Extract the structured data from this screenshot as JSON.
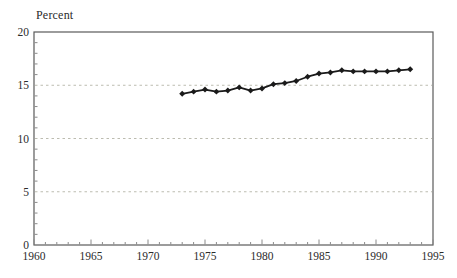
{
  "chart_data": {
    "type": "line",
    "title": "",
    "ylabel": "Percent",
    "xlabel": "",
    "xlim": [
      1960,
      1995
    ],
    "ylim": [
      0,
      20
    ],
    "x_ticks": [
      1960,
      1965,
      1970,
      1975,
      1980,
      1985,
      1990,
      1995
    ],
    "y_ticks": [
      0,
      5,
      10,
      15,
      20
    ],
    "grid": "horizontal dashed lines at 5, 10, 15",
    "legend": "none",
    "series": [
      {
        "name": "Percent",
        "x": [
          1973,
          1974,
          1975,
          1976,
          1977,
          1978,
          1979,
          1980,
          1981,
          1982,
          1983,
          1984,
          1985,
          1986,
          1987,
          1988,
          1989,
          1990,
          1991,
          1992,
          1993
        ],
        "values": [
          14.2,
          14.4,
          14.6,
          14.4,
          14.5,
          14.8,
          14.5,
          14.7,
          15.1,
          15.2,
          15.4,
          15.8,
          16.1,
          16.2,
          16.4,
          16.3,
          16.3,
          16.3,
          16.3,
          16.4,
          16.5
        ]
      }
    ],
    "colors": {
      "line": "#1a1a1a",
      "grid": "#bcbcb0",
      "frame": "#5a5a5a",
      "tick": "#8a8a8a",
      "text": "#2b2b2b",
      "background": "#ffffff"
    }
  }
}
